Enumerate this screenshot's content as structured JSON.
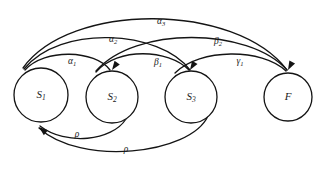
{
  "diagram": {
    "type": "state-machine",
    "canvas": {
      "width": 330,
      "height": 170,
      "background": "#ffffff"
    },
    "stroke_color": "#141414",
    "nodes": [
      {
        "id": "S1",
        "label": "S",
        "sub": "1",
        "cx": 41,
        "cy": 95,
        "r": 27
      },
      {
        "id": "S2",
        "label": "S",
        "sub": "2",
        "cx": 112,
        "cy": 97,
        "r": 26
      },
      {
        "id": "S3",
        "label": "S",
        "sub": "3",
        "cx": 191,
        "cy": 97,
        "r": 26
      },
      {
        "id": "F",
        "label": "F",
        "sub": "",
        "cx": 288,
        "cy": 97,
        "r": 24
      }
    ],
    "edges": [
      {
        "id": "e-a1",
        "from": "S1",
        "to": "S2",
        "label": "α",
        "sub": "1",
        "lx": 72,
        "ly": 62,
        "d": "M 25 70 C 45 48, 95 50, 110 70"
      },
      {
        "id": "e-a2",
        "from": "S1",
        "to": "S3",
        "label": "α",
        "sub": "2",
        "lx": 113,
        "ly": 40,
        "d": "M 24 69 C 60 24, 160 30, 190 70"
      },
      {
        "id": "e-a3",
        "from": "S1",
        "to": "F",
        "label": "α",
        "sub": "3",
        "lx": 161,
        "ly": 22,
        "d": "M 23 68 C 70 2, 235 2, 287 70"
      },
      {
        "id": "e-b1",
        "from": "S2",
        "to": "S3",
        "label": "β",
        "sub": "1",
        "lx": 158,
        "ly": 63,
        "d": "M 96 72 C 118 47, 168 49, 189 70"
      },
      {
        "id": "e-b2",
        "from": "S2",
        "to": "F",
        "label": "β",
        "sub": "2",
        "lx": 218,
        "ly": 42,
        "d": "M 96 71 C 135 26, 248 27, 287 70"
      },
      {
        "id": "e-g1",
        "from": "S3",
        "to": "F",
        "label": "γ",
        "sub": "1",
        "lx": 240,
        "ly": 62,
        "d": "M 175 73 C 200 48, 262 48, 286 71"
      },
      {
        "id": "e-r1",
        "from": "S2",
        "to": "S1",
        "label": "ρ",
        "sub": "",
        "lx": 77,
        "ly": 135,
        "d": "M 126 119 C 112 141, 66 146, 40 126"
      },
      {
        "id": "e-r2",
        "from": "S3",
        "to": "S1",
        "label": "ρ",
        "sub": "",
        "lx": 126,
        "ly": 150,
        "d": "M 208 116 C 190 155, 80 166, 39 128"
      }
    ],
    "arrowheads": [
      {
        "id": "ah-S2-top",
        "x": 112,
        "y": 70,
        "angle": 125
      },
      {
        "id": "ah-S3-top",
        "x": 190,
        "y": 70,
        "angle": 122
      },
      {
        "id": "ah-F-top",
        "x": 288,
        "y": 70,
        "angle": 118
      },
      {
        "id": "ah-S1-bottom",
        "x": 39,
        "y": 127,
        "angle": -140
      }
    ]
  }
}
